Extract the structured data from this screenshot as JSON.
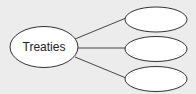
{
  "diagram": {
    "type": "concept-web",
    "center_node": {
      "label": "Treaties"
    },
    "branch_nodes": [
      {
        "label": ""
      },
      {
        "label": ""
      },
      {
        "label": ""
      }
    ]
  },
  "colors": {
    "background": "#ececec",
    "node_fill": "#ffffff",
    "stroke": "#333333"
  }
}
